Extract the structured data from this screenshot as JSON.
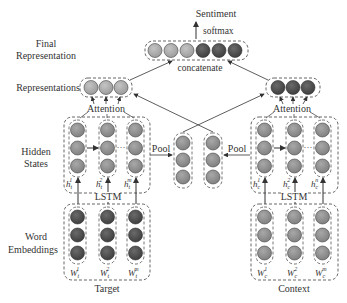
{
  "labels": {
    "sentiment": "Sentiment",
    "softmax": "softmax",
    "final_representation_line1": "Final",
    "final_representation_line2": "Representation",
    "concatenate": "concatenate",
    "representations": "Representations",
    "attention_left": "Attention",
    "attention_right": "Attention",
    "hidden_states_line1": "Hidden",
    "hidden_states_line2": "States",
    "pool_left": "Pool",
    "pool_right": "Pool",
    "lstm_left": "LSTM",
    "lstm_right": "LSTM",
    "word_embeddings_line1": "Word",
    "word_embeddings_line2": "Embeddings",
    "target": "Target",
    "context": "Context",
    "dots": "···"
  },
  "hidden_labels": {
    "target": [
      {
        "base": "h",
        "sub": "t",
        "sup": "1"
      },
      {
        "base": "h",
        "sub": "t",
        "sup": "2"
      },
      {
        "base": "h",
        "sub": "t",
        "sup": "m"
      }
    ],
    "context": [
      {
        "base": "h",
        "sub": "c",
        "sup": "1"
      },
      {
        "base": "h",
        "sub": "c",
        "sup": "2"
      },
      {
        "base": "h",
        "sub": "c",
        "sup": "n"
      }
    ]
  },
  "embedding_labels": {
    "target": [
      {
        "base": "W",
        "sub": "t",
        "sup": "1"
      },
      {
        "base": "W",
        "sub": "t",
        "sup": "2"
      },
      {
        "base": "W",
        "sub": "t",
        "sup": "m"
      }
    ],
    "context": [
      {
        "base": "W",
        "sub": "c",
        "sup": "1"
      },
      {
        "base": "W",
        "sub": "c",
        "sup": "2"
      },
      {
        "base": "W",
        "sub": "c",
        "sup": "m"
      }
    ]
  },
  "colors": {
    "light_node": "#a6a6a6",
    "mid_node": "#8c8c8c",
    "dark_node": "#4d4d4d",
    "line": "#444444",
    "dashed": "#555555"
  }
}
